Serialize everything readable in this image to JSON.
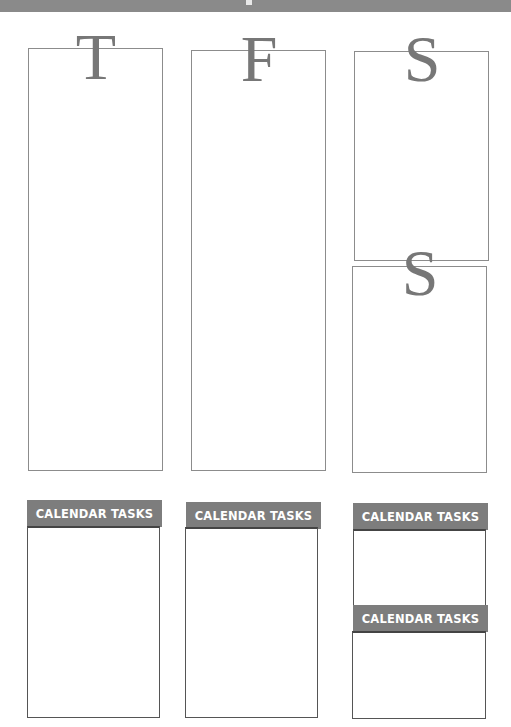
{
  "page": {
    "header_band_color": "#8a8a8a",
    "accent_gray": "#7d7d7d",
    "letter_color": "#777777"
  },
  "days": [
    {
      "letter": "T"
    },
    {
      "letter": "F"
    },
    {
      "letter": "S"
    },
    {
      "letter": "S"
    }
  ],
  "tasks": [
    {
      "label": "CALENDAR TASKS"
    },
    {
      "label": "CALENDAR TASKS"
    },
    {
      "label": "CALENDAR TASKS"
    },
    {
      "label": "CALENDAR TASKS"
    }
  ]
}
